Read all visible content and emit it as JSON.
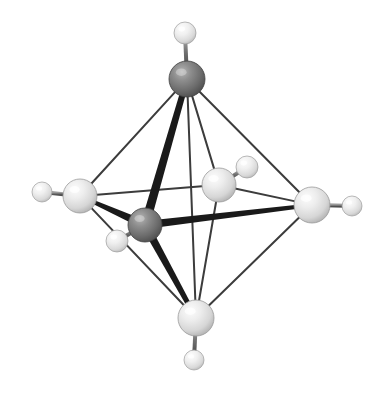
{
  "figure": {
    "background_color": "#ffffff",
    "width": 391,
    "height": 395
  },
  "palette": {
    "dark_atom_base": "#6e6e6e",
    "dark_atom_highlight": "#a8a8a8",
    "dark_atom_shadow": "#4a4a4a",
    "light_atom_base": "#dcdcdc",
    "light_atom_highlight": "#f7f7f7",
    "light_atom_shadow": "#a9a9a9",
    "thick_bond_color": "#1a1a1a",
    "thin_bond_color": "#3c3c3c",
    "hydrogen_bond_color": "#6a6a6a"
  },
  "atoms": [
    {
      "id": "metal-top",
      "label": "M1",
      "kind": "dark",
      "cx": 187,
      "cy": 79,
      "r": 18
    },
    {
      "id": "metal-center",
      "label": "M2",
      "kind": "dark",
      "cx": 145,
      "cy": 225,
      "r": 17
    },
    {
      "id": "ligand-left",
      "label": "L1",
      "kind": "light",
      "cx": 80,
      "cy": 196,
      "r": 17
    },
    {
      "id": "ligand-right",
      "label": "L2",
      "kind": "light",
      "cx": 312,
      "cy": 205,
      "r": 18
    },
    {
      "id": "ligand-back",
      "label": "L3",
      "kind": "light",
      "cx": 219,
      "cy": 185,
      "r": 17
    },
    {
      "id": "ligand-bottom",
      "label": "L4",
      "kind": "light",
      "cx": 196,
      "cy": 318,
      "r": 18
    }
  ],
  "hydrogens": [
    {
      "id": "h-top",
      "label": "H1",
      "cx": 185,
      "cy": 33,
      "r": 11,
      "bonded_to": "metal-top"
    },
    {
      "id": "h-left",
      "label": "H2",
      "cx": 42,
      "cy": 192,
      "r": 10,
      "bonded_to": "ligand-left"
    },
    {
      "id": "h-right",
      "label": "H3",
      "cx": 352,
      "cy": 206,
      "r": 10,
      "bonded_to": "ligand-right"
    },
    {
      "id": "h-back",
      "label": "H4",
      "cx": 247,
      "cy": 167,
      "r": 11,
      "bonded_to": "ligand-back"
    },
    {
      "id": "h-bottom",
      "label": "H5",
      "cx": 194,
      "cy": 360,
      "r": 10,
      "bonded_to": "ligand-bottom"
    },
    {
      "id": "h-center",
      "label": "H6",
      "cx": 117,
      "cy": 241,
      "r": 11,
      "bonded_to": "metal-center"
    }
  ],
  "thick_bonds": [
    {
      "id": "bond-center-top",
      "from": "metal-center",
      "to": "metal-top",
      "width": 9,
      "taper": 6
    },
    {
      "id": "bond-center-left",
      "from": "metal-center",
      "to": "ligand-left",
      "width": 8,
      "taper": 4
    },
    {
      "id": "bond-center-right",
      "from": "metal-center",
      "to": "ligand-right",
      "width": 8,
      "taper": 4
    },
    {
      "id": "bond-center-bottom",
      "from": "metal-center",
      "to": "ligand-bottom",
      "width": 8,
      "taper": 5
    }
  ],
  "thin_bonds": [
    {
      "id": "edge-top-left",
      "from": "metal-top",
      "to": "ligand-left",
      "width": 2
    },
    {
      "id": "edge-top-right",
      "from": "metal-top",
      "to": "ligand-right",
      "width": 2
    },
    {
      "id": "edge-top-back",
      "from": "metal-top",
      "to": "ligand-back",
      "width": 2
    },
    {
      "id": "edge-top-bottomfar",
      "from": "metal-top",
      "to": "ligand-bottom",
      "width": 2
    },
    {
      "id": "edge-left-back",
      "from": "ligand-left",
      "to": "ligand-back",
      "width": 2
    },
    {
      "id": "edge-back-right",
      "from": "ligand-back",
      "to": "ligand-right",
      "width": 2
    },
    {
      "id": "edge-left-bottom",
      "from": "ligand-left",
      "to": "ligand-bottom",
      "width": 2
    },
    {
      "id": "edge-right-bottom",
      "from": "ligand-right",
      "to": "ligand-bottom",
      "width": 2
    },
    {
      "id": "edge-back-bottom",
      "from": "ligand-back",
      "to": "ligand-bottom",
      "width": 2
    }
  ],
  "hydrogen_bonds": [
    {
      "id": "hbond-top",
      "from": "metal-top",
      "to": "h-top",
      "width": 4
    },
    {
      "id": "hbond-left",
      "from": "ligand-left",
      "to": "h-left",
      "width": 4
    },
    {
      "id": "hbond-right",
      "from": "ligand-right",
      "to": "h-right",
      "width": 4
    },
    {
      "id": "hbond-back",
      "from": "ligand-back",
      "to": "h-back",
      "width": 4
    },
    {
      "id": "hbond-bottom",
      "from": "ligand-bottom",
      "to": "h-bottom",
      "width": 4
    },
    {
      "id": "hbond-center",
      "from": "metal-center",
      "to": "h-center",
      "width": 4
    }
  ]
}
